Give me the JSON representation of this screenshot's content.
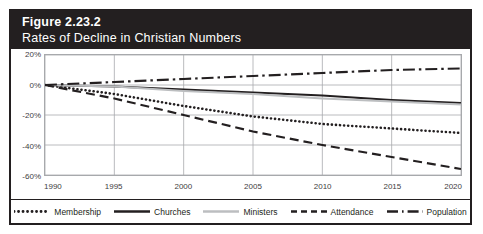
{
  "figure": {
    "number": "Figure 2.23.2",
    "title": "Rates of Decline in Christian Numbers",
    "header_bg": "#231f20",
    "header_text_color": "#ffffff",
    "border_color": "#231f20"
  },
  "axes": {
    "y_ticks": [
      "20%",
      "0%",
      "-20%",
      "-40%",
      "-60%"
    ],
    "x_ticks": [
      "1990",
      "1995",
      "2000",
      "2005",
      "2010",
      "2015",
      "2020"
    ]
  },
  "legend": {
    "position": "bottom",
    "items": [
      {
        "label": "Membership",
        "style": "dotted",
        "color": "#231f20"
      },
      {
        "label": "Churches",
        "style": "solid",
        "color": "#231f20"
      },
      {
        "label": "Ministers",
        "style": "solid",
        "color": "#bcbec0"
      },
      {
        "label": "Attendance",
        "style": "dashed",
        "color": "#231f20"
      },
      {
        "label": "Population",
        "style": "dashdot",
        "color": "#231f20"
      }
    ]
  },
  "chart_data": {
    "type": "line",
    "title": "Rates of Decline in Christian Numbers",
    "xlabel": "",
    "ylabel": "",
    "xlim": [
      1990,
      2020
    ],
    "ylim": [
      -60,
      20
    ],
    "grid": true,
    "y_tick_values": [
      20,
      0,
      -20,
      -40,
      -60
    ],
    "x_tick_values": [
      1990,
      1995,
      2000,
      2005,
      2010,
      2015,
      2020
    ],
    "x": [
      1990,
      1995,
      2000,
      2005,
      2010,
      2015,
      2020
    ],
    "series": [
      {
        "name": "Membership",
        "style": "dotted",
        "color": "#231f20",
        "values": [
          0,
          -6,
          -14,
          -21,
          -26,
          -29,
          -32
        ]
      },
      {
        "name": "Churches",
        "style": "solid",
        "color": "#231f20",
        "values": [
          0,
          -1,
          -3,
          -5,
          -7,
          -10,
          -12
        ]
      },
      {
        "name": "Ministers",
        "style": "solid",
        "color": "#bcbec0",
        "values": [
          0,
          -1,
          -4,
          -6,
          -9,
          -11,
          -13
        ]
      },
      {
        "name": "Attendance",
        "style": "dashed",
        "color": "#231f20",
        "values": [
          0,
          -9,
          -20,
          -31,
          -40,
          -48,
          -56
        ]
      },
      {
        "name": "Population",
        "style": "dashdot",
        "color": "#231f20",
        "values": [
          0,
          2,
          4,
          6,
          8,
          10,
          11
        ]
      }
    ]
  }
}
